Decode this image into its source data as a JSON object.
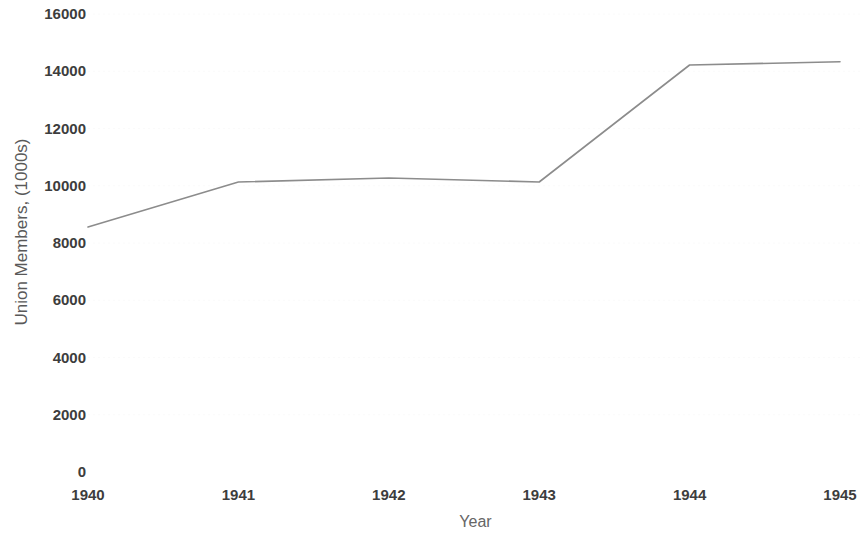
{
  "chart_data": {
    "type": "line",
    "title": "",
    "xlabel": "Year",
    "ylabel": "Union Members, (1000s)",
    "categories": [
      "1940",
      "1941",
      "1942",
      "1943",
      "1944",
      "1945"
    ],
    "x": [
      1940,
      1941,
      1942,
      1943,
      1944,
      1945
    ],
    "values": [
      8560,
      10130,
      10270,
      10130,
      14220,
      14330
    ],
    "series": [
      {
        "name": "Union Members",
        "values": [
          8560,
          10130,
          10270,
          10130,
          14220,
          14330
        ]
      }
    ],
    "ylim": [
      0,
      16000
    ],
    "yticks": [
      0,
      2000,
      4000,
      6000,
      8000,
      10000,
      12000,
      14000,
      16000
    ],
    "ytick_labels": [
      "0",
      "2000",
      "4000",
      "6000",
      "8000",
      "10000",
      "12000",
      "14000",
      "16000"
    ],
    "xtick_labels": [
      "1940",
      "1941",
      "1942",
      "1943",
      "1944",
      "1945"
    ],
    "grid": true,
    "grid_style": "faint-dotted-horizontal",
    "legend": false,
    "legend_position": "none",
    "line_color": "#8c8c8c",
    "grid_color": "#fafafa",
    "tick_label_color": "#3d3d3d",
    "axis_title_color": "#666666",
    "background_color": "#ffffff"
  }
}
